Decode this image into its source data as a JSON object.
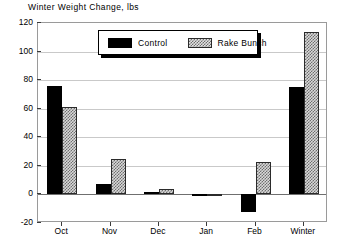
{
  "chart_data": {
    "type": "bar",
    "title": "Winter Weight Change, lbs",
    "xlabel": "",
    "ylabel": "",
    "ylim": [
      -20,
      120
    ],
    "yticks": [
      120,
      100,
      80,
      60,
      40,
      20,
      0,
      -20
    ],
    "ytick_labels": [
      "120",
      "100",
      "80",
      "60",
      "40",
      "20",
      "0",
      "-20"
    ],
    "grid": true,
    "legend_position": "upper center",
    "categories": [
      "Oct",
      "Nov",
      "Dec",
      "Jan",
      "Feb",
      "Winter"
    ],
    "series": [
      {
        "name": "Control",
        "fill": "solid-black",
        "color": "#000000",
        "values": [
          76,
          7,
          2,
          0.5,
          -12,
          75
        ]
      },
      {
        "name": "Rake Bunch",
        "fill": "checkered-hatch",
        "color": "#d8d8d8",
        "values": [
          61,
          25,
          4,
          0.5,
          23,
          114
        ]
      }
    ]
  },
  "legend": {
    "entries": [
      {
        "label": "Control"
      },
      {
        "label": "Rake Bunch"
      }
    ]
  },
  "colors": {
    "frame": "#9a9a9a",
    "gridline": "#c9c9c9",
    "zeroline": "#6f6f6f",
    "text": "#000000",
    "background": "#ffffff"
  }
}
